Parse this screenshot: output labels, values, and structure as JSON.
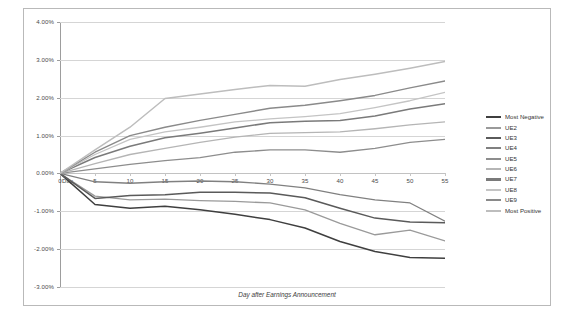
{
  "chart_data": {
    "type": "line",
    "title": "",
    "xlabel": "Day after Earnings Announcement",
    "ylabel": "Cumulative Excess Return (%)",
    "origin_label": "Day",
    "xlim": [
      0,
      55
    ],
    "ylim": [
      -3,
      4
    ],
    "grid": true,
    "legend_position": "right",
    "x": [
      0,
      5,
      10,
      15,
      20,
      25,
      30,
      35,
      40,
      45,
      50,
      55
    ],
    "xticks": [
      "0",
      "5",
      "10",
      "15",
      "20",
      "25",
      "30",
      "35",
      "40",
      "45",
      "50",
      "55"
    ],
    "yticks": [
      "4.00%",
      "3.00%",
      "2.00%",
      "1.00%",
      "0.00%",
      "-1.00%",
      "-2.00%",
      "-3.00%"
    ],
    "ytick_values": [
      4,
      3,
      2,
      1,
      0,
      -1,
      -2,
      -3
    ],
    "series": [
      {
        "name": "Most Negative",
        "color": "#3f3f3f",
        "width": 1.5,
        "values": [
          0.0,
          -0.82,
          -0.92,
          -0.87,
          -0.96,
          -1.08,
          -1.22,
          -1.44,
          -1.8,
          -2.06,
          -2.22,
          -2.24
        ]
      },
      {
        "name": "UE2",
        "color": "#9a9a9a",
        "width": 1.3,
        "values": [
          0.0,
          -0.6,
          -0.7,
          -0.68,
          -0.72,
          -0.74,
          -0.78,
          -0.96,
          -1.32,
          -1.62,
          -1.5,
          -1.78
        ]
      },
      {
        "name": "UE3",
        "color": "#5a5a5a",
        "width": 1.5,
        "values": [
          0.0,
          -0.66,
          -0.58,
          -0.56,
          -0.5,
          -0.5,
          -0.52,
          -0.64,
          -0.92,
          -1.18,
          -1.28,
          -1.3
        ]
      },
      {
        "name": "UE4",
        "color": "#808080",
        "width": 1.3,
        "values": [
          0.0,
          -0.22,
          -0.26,
          -0.22,
          -0.2,
          -0.22,
          -0.28,
          -0.38,
          -0.56,
          -0.7,
          -0.78,
          -1.26
        ]
      },
      {
        "name": "UE5",
        "color": "#8d8d8d",
        "width": 1.3,
        "values": [
          0.0,
          0.12,
          0.24,
          0.34,
          0.42,
          0.56,
          0.62,
          0.62,
          0.56,
          0.66,
          0.82,
          0.9
        ]
      },
      {
        "name": "UE6",
        "color": "#b5b5b5",
        "width": 1.3,
        "values": [
          0.0,
          0.26,
          0.5,
          0.66,
          0.82,
          0.96,
          1.06,
          1.08,
          1.1,
          1.18,
          1.28,
          1.36
        ]
      },
      {
        "name": "UE7",
        "color": "#7a7a7a",
        "width": 1.5,
        "values": [
          0.0,
          0.42,
          0.72,
          0.94,
          1.06,
          1.2,
          1.34,
          1.38,
          1.4,
          1.52,
          1.7,
          1.84
        ]
      },
      {
        "name": "UE8",
        "color": "#c4c4c4",
        "width": 1.3,
        "values": [
          0.0,
          0.5,
          0.9,
          1.1,
          1.22,
          1.36,
          1.44,
          1.5,
          1.58,
          1.74,
          1.92,
          2.14
        ]
      },
      {
        "name": "UE9",
        "color": "#8a8a8a",
        "width": 1.4,
        "values": [
          0.0,
          0.56,
          1.0,
          1.22,
          1.4,
          1.56,
          1.72,
          1.8,
          1.92,
          2.06,
          2.26,
          2.44
        ]
      },
      {
        "name": "Most Positive",
        "color": "#bdbdbd",
        "width": 1.5,
        "values": [
          0.0,
          0.62,
          1.22,
          1.98,
          2.1,
          2.22,
          2.32,
          2.3,
          2.48,
          2.62,
          2.78,
          2.96
        ]
      }
    ]
  }
}
